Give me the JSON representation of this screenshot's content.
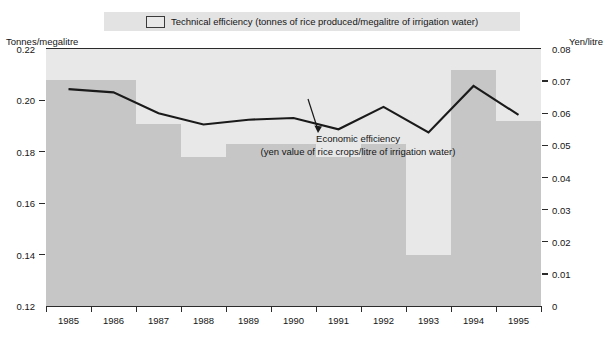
{
  "legend": {
    "swatch_name": "technical-efficiency-swatch",
    "label": "Technical efficiency (tonnes of rice produced/megalitre of irrigation water)"
  },
  "axes": {
    "left_caption": "Tonnes/megalitre",
    "right_caption": "Yen/litre",
    "left_ticks": [
      "0.22",
      "0.20",
      "0.18",
      "0.16",
      "0.14",
      "0.12"
    ],
    "right_ticks": [
      "0.08",
      "0.07",
      "0.06",
      "0.05",
      "0.04",
      "0.03",
      "0.02",
      "0.01",
      "0"
    ]
  },
  "annotation": {
    "line1": "Economic efficiency",
    "line2": "(yen value of rice crops/litre of irrigation water)"
  },
  "chart_data": {
    "type": "bar",
    "title": "",
    "subtitle": "",
    "xlabel": "",
    "ylabel": "Tonnes/megalitre",
    "y2label": "Yen/litre",
    "ylim": [
      0.12,
      0.22
    ],
    "y2lim": [
      0,
      0.08
    ],
    "ytick_values": [
      0.22,
      0.2,
      0.18,
      0.16,
      0.14,
      0.12
    ],
    "y2tick_values": [
      0.08,
      0.07,
      0.06,
      0.05,
      0.04,
      0.03,
      0.02,
      0.01,
      0
    ],
    "grid": false,
    "legend_position": "top",
    "categories": [
      "1985",
      "1986",
      "1987",
      "1988",
      "1989",
      "1990",
      "1991",
      "1992",
      "1993",
      "1994",
      "1995"
    ],
    "series": [
      {
        "name": "Technical efficiency (tonnes of rice produced/megalitre of irrigation water)",
        "type": "bar",
        "axis": "left",
        "units": "tonnes/megalitre",
        "color": "#c6c6c6",
        "values": [
          0.208,
          0.208,
          0.191,
          0.178,
          0.183,
          0.183,
          0.178,
          0.183,
          0.14,
          0.212,
          0.192
        ]
      },
      {
        "name": "Economic efficiency (yen value of rice crops/litre of irrigation water)",
        "type": "line",
        "axis": "right",
        "units": "yen/litre",
        "color": "#1a1a1a",
        "values": [
          0.0675,
          0.0665,
          0.06,
          0.0565,
          0.058,
          0.0585,
          0.055,
          0.062,
          0.054,
          0.0685,
          0.0595
        ]
      }
    ]
  },
  "colors": {
    "plot_background": "#e8e8e8",
    "bar_fill": "#c6c6c6",
    "line": "#1a1a1a",
    "legend_band": "#e3e3e3",
    "axis": "#2b2b2b"
  }
}
